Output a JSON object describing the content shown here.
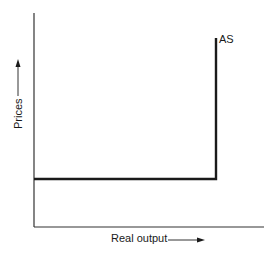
{
  "chart_data": {
    "type": "line",
    "title": "",
    "xlabel": "Real output",
    "ylabel": "Prices",
    "grid": false,
    "legend": null,
    "series": [
      {
        "name": "AS",
        "description": "Reverse-L (Keynesian) aggregate supply: horizontal at a fixed price level until full-employment output, then vertical",
        "points": [
          {
            "x": 0,
            "y": 0.3
          },
          {
            "x": 0.8,
            "y": 0.3
          },
          {
            "x": 0.8,
            "y": 0.9
          }
        ]
      }
    ],
    "annotations": [
      {
        "text": "AS",
        "x": 0.82,
        "y": 0.9
      }
    ],
    "xlim": [
      0,
      1
    ],
    "ylim": [
      0,
      1
    ],
    "ticks": "none"
  },
  "labels": {
    "curve": "AS",
    "x_axis": "Real output",
    "y_axis": "Prices"
  }
}
